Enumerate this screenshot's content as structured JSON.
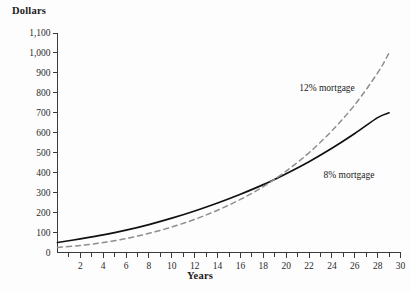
{
  "chart_data": {
    "type": "line",
    "title": "",
    "xlabel": "Years",
    "ylabel": "Dollars",
    "xlim": [
      0,
      30
    ],
    "ylim": [
      0,
      1100
    ],
    "grid": false,
    "legend_position": "inline-annotations",
    "x_tick_labels": [
      "2",
      "4",
      "6",
      "8",
      "10",
      "12",
      "14",
      "16",
      "18",
      "20",
      "22",
      "24",
      "26",
      "28",
      "30"
    ],
    "x_tick_values": [
      2,
      4,
      6,
      8,
      10,
      12,
      14,
      16,
      18,
      20,
      22,
      24,
      26,
      28,
      30
    ],
    "x_minor_tick_values": [
      1,
      3,
      5,
      7,
      9,
      11,
      13,
      15,
      17,
      19,
      21,
      23,
      25,
      27,
      29
    ],
    "y_tick_labels": [
      "0",
      "100",
      "200",
      "300",
      "400",
      "500",
      "600",
      "700",
      "800",
      "900",
      "1,000",
      "1,100"
    ],
    "y_tick_values": [
      0,
      100,
      200,
      300,
      400,
      500,
      600,
      700,
      800,
      900,
      1000,
      1100
    ],
    "x": [
      0,
      2,
      4,
      6,
      8,
      10,
      12,
      14,
      16,
      18,
      20,
      22,
      24,
      26,
      28,
      29
    ],
    "series": [
      {
        "name": "8% mortgage",
        "label": "8% mortgage",
        "style": "solid",
        "color": "#111111",
        "values": [
          50,
          68,
          88,
          112,
          140,
          172,
          208,
          248,
          292,
          340,
          395,
          455,
          522,
          596,
          676,
          700
        ]
      },
      {
        "name": "12% mortgage",
        "label": "12% mortgage",
        "style": "dashed",
        "color": "#8e8e8e",
        "values": [
          25,
          35,
          50,
          70,
          96,
          128,
          166,
          212,
          266,
          330,
          408,
          500,
          610,
          740,
          900,
          1000
        ]
      }
    ],
    "annotations": [
      {
        "text": "12% mortgage",
        "x_px": 327,
        "y_px": 88
      },
      {
        "text": "8% mortgage",
        "x_px": 349,
        "y_px": 175
      }
    ],
    "colors": {
      "background": "#fdfdfd",
      "axis": "#3a3a3a",
      "text": "#1a1a1a",
      "series_8": "#111111",
      "series_12": "#8e8e8e"
    }
  }
}
